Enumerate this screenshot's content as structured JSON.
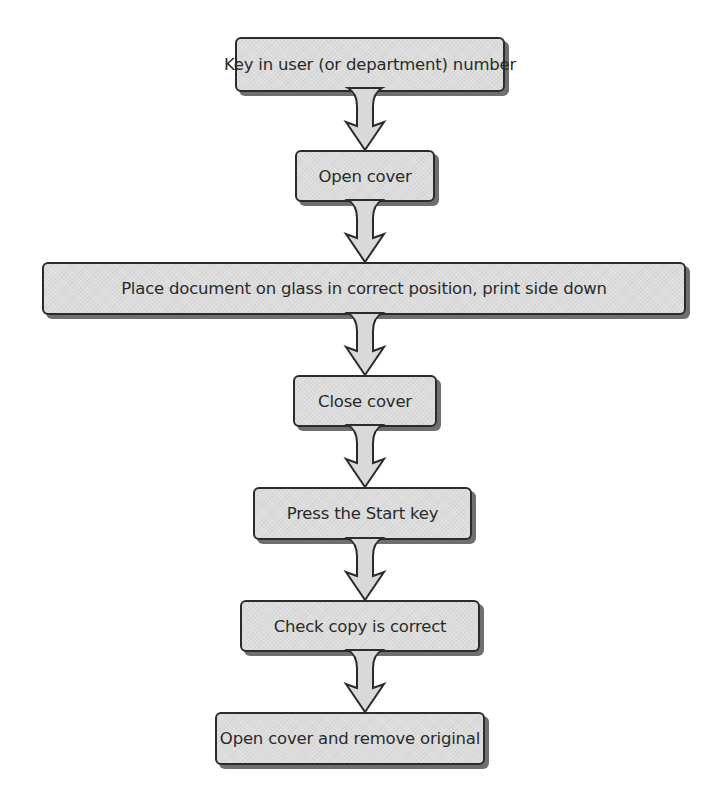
{
  "diagram": {
    "type": "flowchart",
    "direction": "top-to-bottom",
    "colors": {
      "box_fill": "#dcdcdc",
      "box_border": "#2b2b2b",
      "box_shadow": "#6f6f6f",
      "arrow_fill": "#d9d9d9",
      "arrow_stroke": "#2b2b2b",
      "text": "#2a2a2a"
    },
    "steps": [
      {
        "label": "Key in user (or department) number"
      },
      {
        "label": "Open cover"
      },
      {
        "label": "Place document on glass in correct position, print side down"
      },
      {
        "label": "Close cover"
      },
      {
        "label": "Press the Start key"
      },
      {
        "label": "Check copy is correct"
      },
      {
        "label": "Open cover and remove original"
      }
    ],
    "connections": [
      {
        "from": 0,
        "to": 1,
        "icon": "down-arrow-icon"
      },
      {
        "from": 1,
        "to": 2,
        "icon": "down-arrow-icon"
      },
      {
        "from": 2,
        "to": 3,
        "icon": "down-arrow-icon"
      },
      {
        "from": 3,
        "to": 4,
        "icon": "down-arrow-icon"
      },
      {
        "from": 4,
        "to": 5,
        "icon": "down-arrow-icon"
      },
      {
        "from": 5,
        "to": 6,
        "icon": "down-arrow-icon"
      }
    ]
  }
}
